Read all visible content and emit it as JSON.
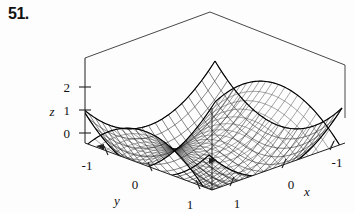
{
  "figure": {
    "problem_number": "51.",
    "caption_present": false
  },
  "chart_data": {
    "type": "line",
    "plot_kind": "3d-surface-wireframe",
    "title": "",
    "subtitle": "",
    "xlabel": "x",
    "ylabel": "y",
    "zlabel": "z",
    "xlim": [
      -1,
      1
    ],
    "ylim": [
      -1,
      1
    ],
    "zlim": [
      0,
      2
    ],
    "grid": false,
    "legend": null,
    "legend_position": "none",
    "x_ticks": [
      -1,
      0,
      1
    ],
    "x_tick_labels": [
      "-1",
      "0",
      "1"
    ],
    "y_ticks": [
      -1,
      0,
      1
    ],
    "y_tick_labels": [
      "-1",
      "0",
      "1"
    ],
    "z_ticks": [
      0,
      1,
      2
    ],
    "z_tick_labels": [
      "0",
      "1",
      "2"
    ],
    "series": [
      {
        "name": "paraboloid",
        "equation": "z = x^2 + y^2",
        "mesh_u": 20,
        "mesh_v": 20,
        "style": "wireframe"
      },
      {
        "name": "hyperbolic-paraboloid",
        "equation": "z = x^2 - y^2 + 1",
        "mesh_u": 20,
        "mesh_v": 20,
        "style": "wireframe"
      }
    ],
    "annotations": []
  },
  "axes": {
    "z": {
      "label": "z",
      "ticks": [
        {
          "value": "2",
          "name": "z-tick-2"
        },
        {
          "value": "1",
          "name": "z-tick-1"
        },
        {
          "value": "0",
          "name": "z-tick-0"
        }
      ]
    },
    "y": {
      "label": "y",
      "ticks": [
        {
          "value": "-1",
          "name": "y-tick-minus1"
        },
        {
          "value": "0",
          "name": "y-tick-0"
        },
        {
          "value": "1",
          "name": "y-tick-1"
        }
      ]
    },
    "x": {
      "label": "x",
      "ticks": [
        {
          "value": "1",
          "name": "x-tick-1"
        },
        {
          "value": "0",
          "name": "x-tick-0"
        },
        {
          "value": "-1",
          "name": "x-tick-minus1"
        }
      ]
    }
  },
  "colors": {
    "ink": "#111111",
    "mesh": "#1a1a1a",
    "background": "#fdfdfd",
    "box": "#333333"
  }
}
